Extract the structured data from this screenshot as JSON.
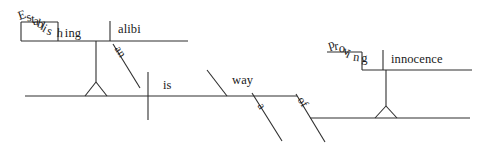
{
  "diagram": {
    "type": "reed-kellogg-sentence-diagram",
    "sentence": "Establishing an alibi is a way of proving innocence",
    "ink_color": "#2e2e2e",
    "background_color": "#ffffff",
    "words": {
      "gerund_subject": "Establishing",
      "gerund_subject_object": "alibi",
      "gerund_subject_object_article": "an",
      "verb": "is",
      "predicate_nominative": "way",
      "predicate_article": "a",
      "preposition": "of",
      "gerund_object_of_prep": "proving",
      "gerund_object_of_prep_object": "innocence"
    },
    "word_list": [
      "Establishing",
      "an",
      "alibi",
      "is",
      "a",
      "way",
      "of",
      "proving",
      "innocence"
    ],
    "establishing_letters": [
      "E",
      "s",
      "t",
      "a",
      "b",
      "l",
      "i",
      "s",
      "h",
      "i",
      "n",
      "g"
    ],
    "proving_letters": [
      "p",
      "r",
      "o",
      "v",
      "i",
      "n",
      "g"
    ]
  }
}
